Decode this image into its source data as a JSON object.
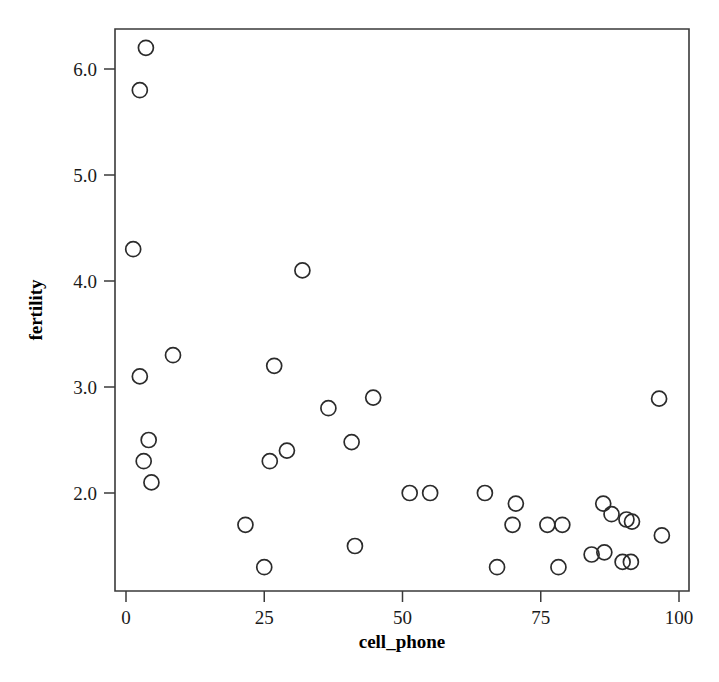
{
  "chart_data": {
    "type": "scatter",
    "title": "",
    "xlabel": "cell_phone",
    "ylabel": "fertility",
    "xlim": [
      -4,
      104
    ],
    "ylim": [
      1.18,
      6.48
    ],
    "xticks": [
      0,
      25,
      50,
      75,
      100
    ],
    "xtick_labels": [
      "0",
      "25",
      "50",
      "75",
      "100"
    ],
    "yticks": [
      2.0,
      3.0,
      4.0,
      5.0,
      6.0
    ],
    "ytick_labels": [
      "2.0",
      "3.0",
      "4.0",
      "5.0",
      "6.0"
    ],
    "grid": false,
    "legend": false,
    "marker": "open-circle",
    "marker_color": "#2b2b2b",
    "points": [
      {
        "x": 3.6,
        "y": 6.2
      },
      {
        "x": 2.5,
        "y": 5.8
      },
      {
        "x": 1.3,
        "y": 4.3
      },
      {
        "x": 31.9,
        "y": 4.1
      },
      {
        "x": 8.5,
        "y": 3.3
      },
      {
        "x": 26.8,
        "y": 3.2
      },
      {
        "x": 2.5,
        "y": 3.1
      },
      {
        "x": 96.4,
        "y": 2.89
      },
      {
        "x": 44.7,
        "y": 2.9
      },
      {
        "x": 36.6,
        "y": 2.8
      },
      {
        "x": 4.1,
        "y": 2.5
      },
      {
        "x": 40.8,
        "y": 2.48
      },
      {
        "x": 29.1,
        "y": 2.4
      },
      {
        "x": 3.2,
        "y": 2.3
      },
      {
        "x": 26.0,
        "y": 2.3
      },
      {
        "x": 4.6,
        "y": 2.1
      },
      {
        "x": 51.3,
        "y": 2.0
      },
      {
        "x": 55.0,
        "y": 2.0
      },
      {
        "x": 64.9,
        "y": 2.0
      },
      {
        "x": 70.5,
        "y": 1.9
      },
      {
        "x": 86.3,
        "y": 1.9
      },
      {
        "x": 87.8,
        "y": 1.8
      },
      {
        "x": 90.5,
        "y": 1.75
      },
      {
        "x": 91.5,
        "y": 1.73
      },
      {
        "x": 69.9,
        "y": 1.7
      },
      {
        "x": 76.2,
        "y": 1.7
      },
      {
        "x": 78.9,
        "y": 1.7
      },
      {
        "x": 21.6,
        "y": 1.7
      },
      {
        "x": 96.9,
        "y": 1.6
      },
      {
        "x": 41.4,
        "y": 1.5
      },
      {
        "x": 84.2,
        "y": 1.42
      },
      {
        "x": 86.5,
        "y": 1.44
      },
      {
        "x": 89.8,
        "y": 1.35
      },
      {
        "x": 91.3,
        "y": 1.35
      },
      {
        "x": 67.1,
        "y": 1.3
      },
      {
        "x": 78.2,
        "y": 1.3
      },
      {
        "x": 25.0,
        "y": 1.3
      }
    ]
  }
}
